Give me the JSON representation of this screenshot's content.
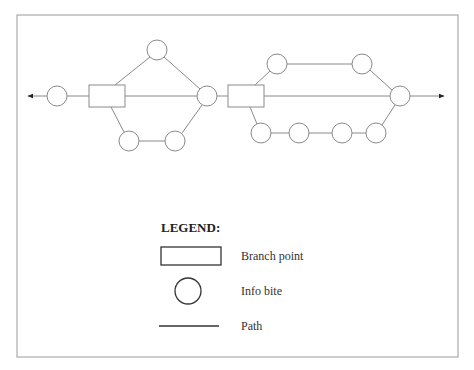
{
  "diagram": {
    "type": "branching-path-flow",
    "nodes": {
      "info_bites": [
        {
          "id": "c1",
          "cx": 57,
          "cy": 96
        },
        {
          "id": "c2",
          "cx": 157,
          "cy": 50
        },
        {
          "id": "c3",
          "cx": 129,
          "cy": 141
        },
        {
          "id": "c4",
          "cx": 175,
          "cy": 141
        },
        {
          "id": "c5",
          "cx": 207,
          "cy": 96
        },
        {
          "id": "c6",
          "cx": 277,
          "cy": 64
        },
        {
          "id": "c7",
          "cx": 362,
          "cy": 64
        },
        {
          "id": "c8",
          "cx": 400,
          "cy": 96
        },
        {
          "id": "c9",
          "cx": 261,
          "cy": 133
        },
        {
          "id": "c10",
          "cx": 299,
          "cy": 133
        },
        {
          "id": "c11",
          "cx": 342,
          "cy": 133
        },
        {
          "id": "c12",
          "cx": 376,
          "cy": 133
        }
      ],
      "branch_points": [
        {
          "id": "b1",
          "x": 89,
          "y": 85,
          "w": 36,
          "h": 22
        },
        {
          "id": "b2",
          "x": 228,
          "y": 85,
          "w": 36,
          "h": 22
        }
      ]
    },
    "arrows": [
      "left",
      "right"
    ]
  },
  "legend": {
    "title": "LEGEND:",
    "items": [
      {
        "shape": "rectangle",
        "label": "Branch point"
      },
      {
        "shape": "circle",
        "label": "Info bite"
      },
      {
        "shape": "line",
        "label": "Path"
      }
    ]
  }
}
